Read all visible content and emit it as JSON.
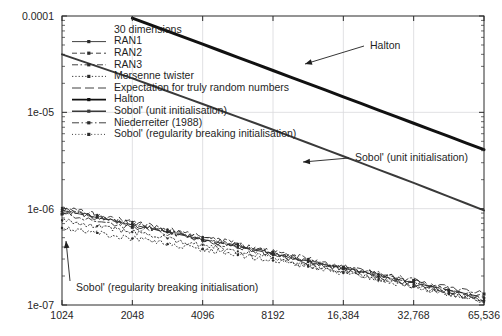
{
  "chart_data": {
    "type": "line",
    "title": "",
    "subtitle": "",
    "xlabel": "",
    "ylabel": "",
    "xscale": "log2",
    "yscale": "log10",
    "xlim": [
      1024,
      65536
    ],
    "ylim": [
      1e-07,
      0.0001
    ],
    "grid": true,
    "legend_position": "top-left-inside",
    "legend_title": "30 dimensions",
    "xticks": [
      {
        "value": 1024,
        "label": "1024"
      },
      {
        "value": 2048,
        "label": "2048"
      },
      {
        "value": 4096,
        "label": "4096"
      },
      {
        "value": 8192,
        "label": "8192"
      },
      {
        "value": 16384,
        "label": "16,384"
      },
      {
        "value": 32768,
        "label": "32,768"
      },
      {
        "value": 65536,
        "label": "65,536"
      }
    ],
    "yticks": [
      {
        "value": 0.0001,
        "label": "0.0001"
      },
      {
        "value": 1e-05,
        "label": "1e-05"
      },
      {
        "value": 1e-06,
        "label": "1e-06"
      },
      {
        "value": 1e-07,
        "label": "1e-07"
      }
    ],
    "series": [
      {
        "name": "RAN1",
        "style": "solid-point",
        "color": "#2b2b2b",
        "x": [
          1024,
          1448,
          2048,
          2896,
          4096,
          5793,
          8192,
          11585,
          16384,
          23170,
          32768,
          46341,
          65536
        ],
        "values": [
          9.4e-07,
          8.1e-07,
          6.8e-07,
          5.7e-07,
          4.8e-07,
          4e-07,
          3.3e-07,
          2.8e-07,
          2.35e-07,
          1.95e-07,
          1.62e-07,
          1.35e-07,
          1.12e-07
        ]
      },
      {
        "name": "RAN2",
        "style": "dashed",
        "color": "#2b2b2b",
        "x": [
          1024,
          1448,
          2048,
          2896,
          4096,
          5793,
          8192,
          11585,
          16384,
          23170,
          32768,
          46341,
          65536
        ],
        "values": [
          1.02e-06,
          8.6e-07,
          7.3e-07,
          6.1e-07,
          5.1e-07,
          4.3e-07,
          3.6e-07,
          3e-07,
          2.5e-07,
          2.1e-07,
          1.75e-07,
          1.45e-07,
          1.2e-07
        ]
      },
      {
        "name": "RAN3",
        "style": "dash-dot",
        "color": "#2b2b2b",
        "x": [
          1024,
          1448,
          2048,
          2896,
          4096,
          5793,
          8192,
          11585,
          16384,
          23170,
          32768,
          46341,
          65536
        ],
        "values": [
          9.8e-07,
          8.3e-07,
          7e-07,
          5.9e-07,
          5e-07,
          4.2e-07,
          3.5e-07,
          2.9e-07,
          2.45e-07,
          2.05e-07,
          1.7e-07,
          1.4e-07,
          1.17e-07
        ]
      },
      {
        "name": "Mersenne twister",
        "style": "dotted",
        "color": "#2b2b2b",
        "x": [
          1024,
          1448,
          2048,
          2896,
          4096,
          5793,
          8192,
          11585,
          16384,
          23170,
          32768,
          46341,
          65536
        ],
        "values": [
          7.6e-07,
          6.6e-07,
          5.7e-07,
          4.9e-07,
          4.2e-07,
          3.6e-07,
          3.1e-07,
          2.6e-07,
          2.2e-07,
          1.86e-07,
          1.56e-07,
          1.31e-07,
          1.1e-07
        ]
      },
      {
        "name": "Expectation for truly random numbers",
        "style": "long-dash",
        "color": "#2b2b2b",
        "x": [
          1024,
          2048,
          4096,
          8192,
          16384,
          32768,
          65536
        ],
        "values": [
          9.6e-07,
          6.8e-07,
          4.8e-07,
          3.4e-07,
          2.4e-07,
          1.7e-07,
          1.2e-07
        ]
      },
      {
        "name": "Halton",
        "style": "solid-thick-point",
        "color": "#111111",
        "x": [
          2048,
          4096,
          8192,
          16384,
          32768,
          65536
        ],
        "values": [
          9.5e-05,
          5.1e-05,
          2.72e-05,
          1.45e-05,
          7.7e-06,
          4.1e-06
        ]
      },
      {
        "name": "Sobol' (unit initialisation)",
        "style": "solid-grey-point",
        "color": "#3a3a3a",
        "x": [
          1024,
          2048,
          4096,
          8192,
          16384,
          32768,
          65536
        ],
        "values": [
          4e-05,
          2.25e-05,
          1.22e-05,
          6.6e-06,
          3.5e-06,
          1.85e-06,
          9.6e-07
        ]
      },
      {
        "name": "Niederreiter (1988)",
        "style": "dash-dot-point",
        "color": "#2b2b2b",
        "x": [
          1024,
          2048,
          4096,
          8192,
          16384,
          32768,
          65536
        ],
        "values": [
          8.8e-07,
          6.4e-07,
          4.7e-07,
          3.4e-07,
          2.45e-07,
          1.8e-07,
          1.3e-07
        ]
      },
      {
        "name": "Sobol' (regularity breaking initialisation)",
        "style": "fine-dotted-point",
        "color": "#2b2b2b",
        "x": [
          1024,
          1448,
          2048,
          2896,
          4096,
          5793,
          8192,
          11585,
          16384,
          23170,
          32768,
          46341,
          65536
        ],
        "values": [
          6.3e-07,
          5.6e-07,
          4.9e-07,
          4.3e-07,
          3.8e-07,
          3.3e-07,
          2.9e-07,
          2.5e-07,
          2.15e-07,
          1.82e-07,
          1.55e-07,
          1.3e-07,
          1.08e-07
        ]
      }
    ],
    "annotations": [
      {
        "label": "Halton",
        "text_x": 370,
        "text_y": 46,
        "tip_x": 305,
        "tip_y": 64
      },
      {
        "label": "Sobol' (unit initialisation)",
        "text_x": 355,
        "text_y": 158,
        "tip_x": 303,
        "tip_y": 162
      },
      {
        "label": "Sobol' (regularity breaking initialisation)",
        "text_x": 76,
        "text_y": 288,
        "tip_x": 66,
        "tip_y": 241
      }
    ]
  },
  "legend": {
    "title": "30 dimensions",
    "entries": [
      {
        "label": "RAN1"
      },
      {
        "label": "RAN2"
      },
      {
        "label": "RAN3"
      },
      {
        "label": "Mersenne twister"
      },
      {
        "label": "Expectation for truly random numbers"
      },
      {
        "label": "Halton"
      },
      {
        "label": "Sobol' (unit initialisation)"
      },
      {
        "label": "Niederreiter (1988)"
      },
      {
        "label": "Sobol' (regularity breaking initialisation)"
      }
    ]
  }
}
